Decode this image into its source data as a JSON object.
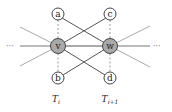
{
  "diagram": {
    "type": "graph",
    "colors": {
      "background": "#ffffff",
      "strong_edge": "#555555",
      "light_edge": "#aaaaaa",
      "dashed_edge": "#999999",
      "node_outline": "#444444",
      "center_node_fill": "#a9a9a9",
      "outer_node_fill": "#ffffff"
    },
    "nodes": [
      {
        "id": "a",
        "label": "a",
        "x": 58,
        "y": 14,
        "r": 6,
        "kind": "outer"
      },
      {
        "id": "c",
        "label": "c",
        "x": 110,
        "y": 14,
        "r": 6,
        "kind": "outer"
      },
      {
        "id": "v",
        "label": "v",
        "x": 58,
        "y": 46,
        "r": 7.5,
        "kind": "center"
      },
      {
        "id": "w",
        "label": "w",
        "x": 110,
        "y": 46,
        "r": 7.5,
        "kind": "center"
      },
      {
        "id": "b",
        "label": "b",
        "x": 58,
        "y": 78,
        "r": 6,
        "kind": "outer"
      },
      {
        "id": "d",
        "label": "d",
        "x": 110,
        "y": 78,
        "r": 6,
        "kind": "outer"
      }
    ],
    "edges": [
      {
        "from": "a",
        "to": "w",
        "style": "strong"
      },
      {
        "from": "c",
        "to": "v",
        "style": "strong"
      },
      {
        "from": "v",
        "to": "d",
        "style": "strong"
      },
      {
        "from": "w",
        "to": "b",
        "style": "strong"
      },
      {
        "from": "v",
        "to": "w",
        "style": "strong"
      },
      {
        "from": "a",
        "to": "v",
        "style": "dashed"
      },
      {
        "from": "v",
        "to": "b",
        "style": "dashed"
      },
      {
        "from": "c",
        "to": "w",
        "style": "dashed"
      },
      {
        "from": "w",
        "to": "d",
        "style": "dashed"
      }
    ],
    "ellipsis_left": "···",
    "ellipsis_right": "···",
    "column_labels": [
      {
        "base": "T",
        "sub": "i",
        "x": 58
      },
      {
        "base": "T",
        "sub": "i+1",
        "x": 110
      }
    ]
  }
}
